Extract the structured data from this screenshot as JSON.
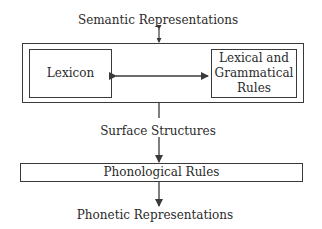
{
  "diagram": {
    "top_label": "Semantic Representations",
    "component_box": {
      "lexicon": "Lexicon",
      "rules_line1": "Lexical and",
      "rules_line2": "Grammatical",
      "rules_line3": "Rules"
    },
    "middle_label": "Surface Structures",
    "phonological_box": "Phonological Rules",
    "bottom_label": "Phonetic Representations",
    "colors": {
      "line": "#3a3a3a",
      "text": "#2a2a2a",
      "background": "#ffffff"
    }
  }
}
